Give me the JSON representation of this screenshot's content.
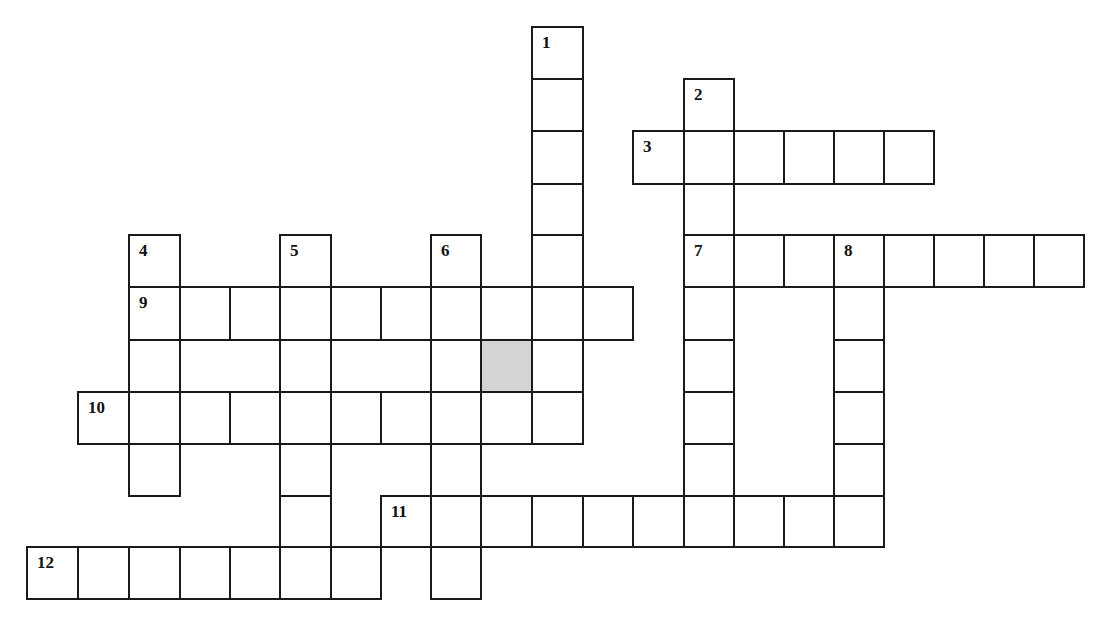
{
  "puzzle": {
    "cell_size": 50,
    "col_x": [
      27,
      78,
      129,
      180,
      230,
      280,
      331,
      381,
      431,
      481,
      532,
      583,
      633,
      684,
      734,
      784,
      834,
      884,
      934,
      984,
      1034,
      1084
    ],
    "row_y": [
      27,
      79,
      131,
      184,
      235,
      287,
      340,
      392,
      444,
      496,
      547,
      599
    ],
    "colors": {
      "border": "#1a1a1a",
      "cell": "#ffffff",
      "shaded": "#d4d4d4"
    },
    "entries": [
      {
        "number": "1",
        "direction": "down",
        "col": 10,
        "row": 0,
        "length": 8
      },
      {
        "number": "2",
        "direction": "down",
        "col": 13,
        "row": 1,
        "length": 9
      },
      {
        "number": "3",
        "direction": "across",
        "col": 12,
        "row": 2,
        "length": 6
      },
      {
        "number": "4",
        "direction": "down",
        "col": 2,
        "row": 4,
        "length": 5
      },
      {
        "number": "5",
        "direction": "down",
        "col": 5,
        "row": 4,
        "length": 6
      },
      {
        "number": "6",
        "direction": "down",
        "col": 8,
        "row": 4,
        "length": 7
      },
      {
        "number": "7",
        "direction": "across",
        "col": 13,
        "row": 4,
        "length": 8
      },
      {
        "number": "8",
        "direction": "down",
        "col": 16,
        "row": 4,
        "length": 6
      },
      {
        "number": "9",
        "direction": "across",
        "col": 2,
        "row": 5,
        "length": 10
      },
      {
        "number": "10",
        "direction": "across",
        "col": 1,
        "row": 7,
        "length": 10
      },
      {
        "number": "11",
        "direction": "across",
        "col": 7,
        "row": 9,
        "length": 9
      },
      {
        "number": "12",
        "direction": "across",
        "col": 0,
        "row": 10,
        "length": 7
      }
    ],
    "shaded_cells": [
      {
        "col": 9,
        "row": 6
      }
    ]
  }
}
